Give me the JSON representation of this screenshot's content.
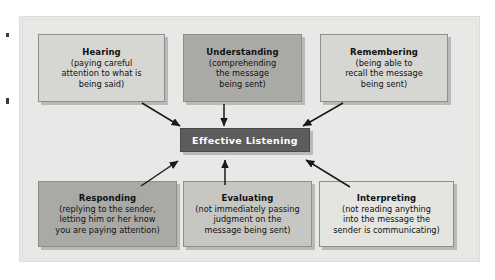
{
  "figure": {
    "title": "Effective Listening",
    "center": {
      "label": "Effective Listening"
    },
    "boxes": [
      {
        "id": "hearing",
        "title": "Hearing",
        "description": "(paying careful\nattention to what is\nbeing said)",
        "tone": "light",
        "row": "top",
        "column": "left"
      },
      {
        "id": "understanding",
        "title": "Understanding",
        "description": "(comprehending\nthe message\nbeing sent)",
        "tone": "dark",
        "row": "top",
        "column": "center"
      },
      {
        "id": "remembering",
        "title": "Remembering",
        "description": "(being able to\nrecall the message\nbeing sent)",
        "tone": "light",
        "row": "top",
        "column": "right"
      },
      {
        "id": "responding",
        "title": "Responding",
        "description": "(replying to the sender,\nletting him or her know\nyou are paying attention)",
        "tone": "dark",
        "row": "bottom",
        "column": "left"
      },
      {
        "id": "evaluating",
        "title": "Evaluating",
        "description": "(not immediately passing\njudgment on the\nmessage being sent)",
        "tone": "medium",
        "row": "bottom",
        "column": "center"
      },
      {
        "id": "interpreting",
        "title": "Interpreting",
        "description": "(not reading anything\ninto the message the\nsender is communicating)",
        "tone": "lighter",
        "row": "bottom",
        "column": "right"
      }
    ],
    "arrows": [
      {
        "from": "hearing",
        "to": "center",
        "direction": "down-right"
      },
      {
        "from": "understanding",
        "to": "center",
        "direction": "down"
      },
      {
        "from": "remembering",
        "to": "center",
        "direction": "down-left"
      },
      {
        "from": "responding",
        "to": "center",
        "direction": "up-right"
      },
      {
        "from": "evaluating",
        "to": "center",
        "direction": "up"
      },
      {
        "from": "interpreting",
        "to": "center",
        "direction": "up-left"
      }
    ],
    "colors": {
      "panel_background": "#e8e8e6",
      "center_fill": "#5c5c5c",
      "center_text": "#ffffff",
      "box_border": "#8e8e8e",
      "arrow": "#1a1a1a",
      "tone_light": "#d6d6d2",
      "tone_medium": "#c6c6c2",
      "tone_dark": "#a9a9a6",
      "tone_lighter": "#e4e4e1"
    }
  }
}
